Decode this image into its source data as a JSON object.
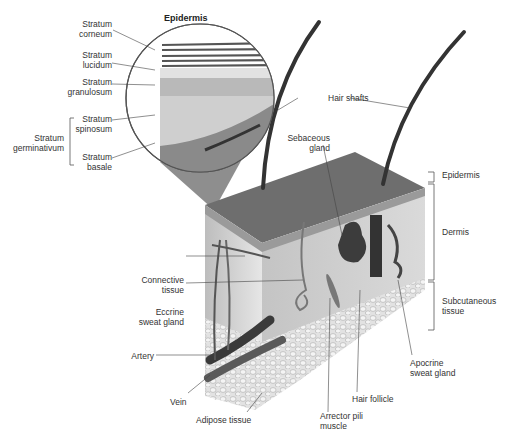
{
  "figure": {
    "inset_title": "Epidermis",
    "inset_labels": [
      {
        "id": "stratum-corneum",
        "line1": "Stratum",
        "line2": "corneum"
      },
      {
        "id": "stratum-lucidum",
        "line1": "Stratum",
        "line2": "lucidum"
      },
      {
        "id": "stratum-granulosum",
        "line1": "Stratum",
        "line2": "granulosum"
      },
      {
        "id": "stratum-spinosum",
        "line1": "Stratum",
        "line2": "spinosum"
      },
      {
        "id": "stratum-basale",
        "line1": "Stratum",
        "line2": "basale"
      }
    ],
    "group_label": {
      "line1": "Stratum",
      "line2": "germinativum"
    },
    "right_labels": [
      {
        "id": "epidermis",
        "text": "Epidermis"
      },
      {
        "id": "dermis",
        "text": "Dermis"
      },
      {
        "id": "subcutaneous",
        "line1": "Subcutaneous",
        "line2": "tissue"
      }
    ],
    "structure_labels": {
      "hair_shafts": "Hair shafts",
      "sebaceous_gland": {
        "line1": "Sebaceous",
        "line2": "gland"
      },
      "connective_tissue": {
        "line1": "Connective",
        "line2": "tissue"
      },
      "eccrine_sweat_gland": {
        "line1": "Eccrine",
        "line2": "sweat gland"
      },
      "artery": "Artery",
      "vein": "Vein",
      "adipose_tissue": "Adipose tissue",
      "arrector_pili": {
        "line1": "Arrector pili",
        "line2": "muscle"
      },
      "hair_follicle": "Hair follicle",
      "apocrine_sweat_gland": {
        "line1": "Apocrine",
        "line2": "sweat gland"
      }
    }
  }
}
